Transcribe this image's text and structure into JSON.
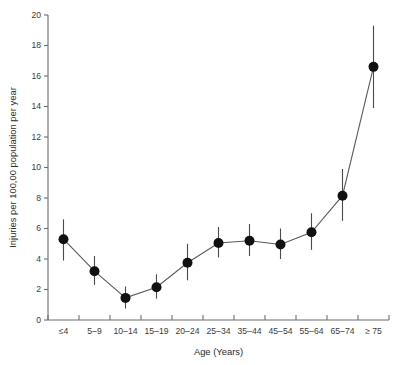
{
  "chart_data": {
    "type": "line",
    "title": "",
    "xlabel": "Age (Years)",
    "ylabel": "Injuries per 100,00 population per year",
    "categories": [
      "≤4",
      "5–9",
      "10–14",
      "15–19",
      "20–24",
      "25–34",
      "35–44",
      "45–54",
      "55–64",
      "65–74",
      "≥ 75"
    ],
    "values": [
      5.3,
      3.2,
      1.45,
      2.15,
      3.75,
      5.05,
      5.2,
      4.95,
      5.75,
      8.15,
      16.6
    ],
    "error_low": [
      3.9,
      2.3,
      0.75,
      1.4,
      2.6,
      4.1,
      4.2,
      4.0,
      4.6,
      6.5,
      13.9
    ],
    "error_high": [
      6.6,
      4.2,
      2.2,
      3.0,
      5.0,
      6.1,
      6.3,
      6.0,
      7.0,
      9.9,
      19.3
    ],
    "ylim": [
      0,
      20
    ],
    "yticks": [
      0,
      2,
      4,
      6,
      8,
      10,
      12,
      14,
      16,
      18,
      20
    ],
    "ytick_labels": [
      "0",
      "2",
      "4",
      "6",
      "8",
      "10",
      "12",
      "14",
      "16",
      "18",
      "20"
    ],
    "grid": false,
    "legend": "none",
    "marker": "filled-circle",
    "series_color": "#111111"
  }
}
